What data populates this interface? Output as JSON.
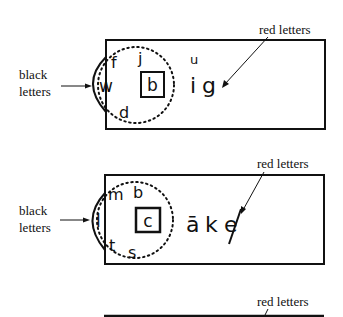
{
  "figure": {
    "panels": [
      {
        "black_label_line1": "black",
        "black_label_line2": "letters",
        "red_label": "red letters",
        "circle_letters": [
          "f",
          "j",
          "w",
          "d"
        ],
        "box_letter": "b",
        "red_letters": [
          "u",
          "i",
          "g"
        ]
      },
      {
        "black_label_line1": "black",
        "black_label_line2": "letters",
        "red_label": "red letters",
        "circle_letters": [
          "m",
          "b",
          "l",
          "t",
          "s"
        ],
        "box_letter": "c",
        "red_letters": [
          "ā",
          "k",
          "e"
        ]
      },
      {
        "red_label": "red letters"
      }
    ]
  }
}
